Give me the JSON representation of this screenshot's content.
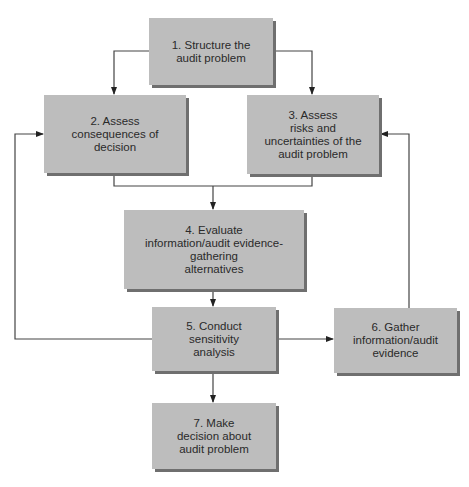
{
  "diagram": {
    "type": "flowchart",
    "colors": {
      "box_fill": "#bdbdbd",
      "box_shadow": "#6f6f6f",
      "line": "#333333",
      "text": "#2a2a2a"
    },
    "nodes": [
      {
        "id": 1,
        "label": "1. Structure the\naudit problem"
      },
      {
        "id": 2,
        "label": "2. Assess\nconsequences of\ndecision"
      },
      {
        "id": 3,
        "label": "3. Assess\nrisks and\nuncertainties of the\naudit problem"
      },
      {
        "id": 4,
        "label": "4. Evaluate\ninformation/audit evidence-\ngathering\nalternatives"
      },
      {
        "id": 5,
        "label": "5. Conduct\nsensitivity\nanalysis"
      },
      {
        "id": 6,
        "label": "6. Gather\ninformation/audit\nevidence"
      },
      {
        "id": 7,
        "label": "7. Make\ndecision about\naudit problem"
      }
    ],
    "edges": [
      {
        "from": 1,
        "to": 2
      },
      {
        "from": 1,
        "to": 3
      },
      {
        "from": 2,
        "to": 4
      },
      {
        "from": 3,
        "to": 4
      },
      {
        "from": 4,
        "to": 5
      },
      {
        "from": 5,
        "to": 6
      },
      {
        "from": 5,
        "to": 7
      },
      {
        "from": 5,
        "to": 2,
        "type": "feedback"
      },
      {
        "from": 6,
        "to": 3,
        "type": "feedback"
      }
    ]
  }
}
